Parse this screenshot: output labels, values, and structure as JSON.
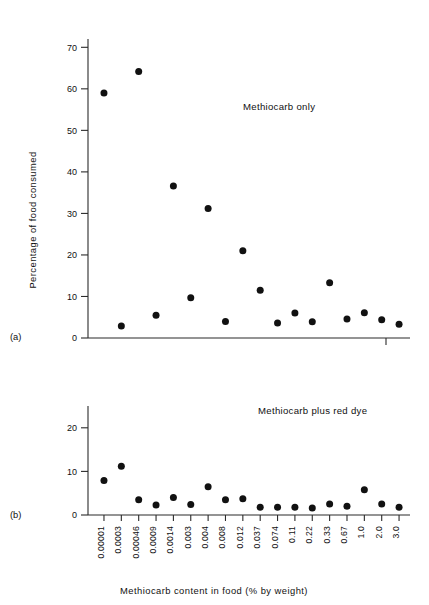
{
  "figure": {
    "xaxis_title": "Methiocarb content in food (% by weight)",
    "yaxis_title": "Percentage of food consumed",
    "panel_a_letter": "(a)",
    "panel_b_letter": "(b)"
  },
  "chart_data": [
    {
      "type": "scatter",
      "panel": "(a)",
      "title": "Methiocarb only",
      "xlabel": "Methiocarb content in food (% by weight)",
      "ylabel": "Percentage of food consumed",
      "categories": [
        "0.00001",
        "0.0003",
        "0.00046",
        "0.0009",
        "0.0014",
        "0.003",
        "0.004",
        "0.008",
        "0.012",
        "0.037",
        "0.074",
        "0.11",
        "0.22",
        "0.33",
        "0.67",
        "1.0",
        "2.0",
        "3.0"
      ],
      "values": [
        59.0,
        2.9,
        64.2,
        5.5,
        36.6,
        9.7,
        31.2,
        4.0,
        21.0,
        11.5,
        3.6,
        6.0,
        3.9,
        13.3,
        4.6,
        6.1,
        4.4,
        3.3
      ],
      "ylim": [
        0,
        72
      ],
      "yticks": [
        0,
        10,
        20,
        30,
        40,
        50,
        60,
        70
      ],
      "ytick_labels": [
        "0",
        "10",
        "20",
        "30",
        "40",
        "50",
        "60",
        "70"
      ],
      "grid": false,
      "legend": "none",
      "marker": "filled-circle"
    },
    {
      "type": "scatter",
      "panel": "(b)",
      "title": "Methiocarb plus red dye",
      "xlabel": "Methiocarb content in food (% by weight)",
      "ylabel": "Percentage of food consumed",
      "categories": [
        "0.00001",
        "0.0003",
        "0.00046",
        "0.0009",
        "0.0014",
        "0.003",
        "0.004",
        "0.008",
        "0.012",
        "0.037",
        "0.074",
        "0.11",
        "0.22",
        "0.33",
        "0.67",
        "1.0",
        "2.0",
        "3.0"
      ],
      "values": [
        7.9,
        11.2,
        3.5,
        2.3,
        4.0,
        2.4,
        6.5,
        3.5,
        3.7,
        1.8,
        1.8,
        1.8,
        1.6,
        2.5,
        2.0,
        5.8,
        2.5,
        1.8
      ],
      "ylim": [
        0,
        25
      ],
      "yticks": [
        0,
        10,
        20
      ],
      "ytick_labels": [
        "0",
        "10",
        "20"
      ],
      "grid": false,
      "legend": "none",
      "marker": "filled-circle"
    }
  ],
  "colors": {
    "marker": "#111111",
    "axis": "#2b2b2b",
    "background": "#ffffff"
  }
}
